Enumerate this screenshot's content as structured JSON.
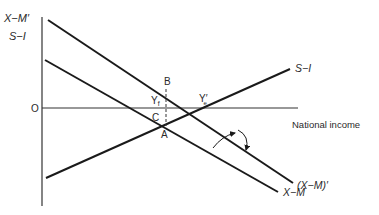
{
  "diagram": {
    "y_axis_labels": [
      "X−M′",
      "S−I"
    ],
    "origin_label": "O",
    "x_axis_label": "National income",
    "lines": [
      {
        "id": "xm-prime",
        "label": "(X−M)′",
        "top_label": "X−M′"
      },
      {
        "id": "xm",
        "label": "X−M"
      },
      {
        "id": "si",
        "label": "S−I"
      }
    ],
    "points": {
      "B": "B",
      "C": "C",
      "A": "A",
      "Yf": "Y",
      "Yf_sub": "f",
      "Ye": "Y′",
      "Ye_sub": "e"
    },
    "line_color": "#1a1a1a",
    "text_color": "#2a2a2a"
  }
}
